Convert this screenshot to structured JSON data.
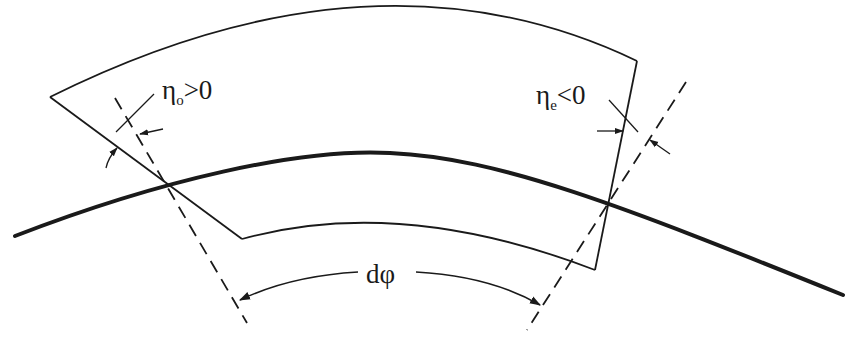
{
  "diagram": {
    "type": "geometric-schematic",
    "labels": {
      "entrance_angle": {
        "symbol": "η",
        "subscript": "o",
        "relation": ">0"
      },
      "exit_angle": {
        "symbol": "η",
        "subscript": "e",
        "relation": "<0"
      },
      "bend_angle": {
        "text": "dφ"
      }
    },
    "elements": [
      "reference-trajectory (thick curve)",
      "pole-face outline (wedge-shaped curved sector)",
      "entrance edge normal (dashed)",
      "exit edge normal (dashed)",
      "angle arrows",
      "dφ dimension arc with arrows"
    ],
    "colors": {
      "line": "#1a1a1a",
      "background": "#ffffff"
    }
  }
}
